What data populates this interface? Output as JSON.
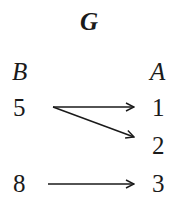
{
  "diagram": {
    "title": "G",
    "domain_label": "B",
    "codomain_label": "A",
    "domain": [
      "5",
      "8"
    ],
    "codomain": [
      "1",
      "2",
      "3"
    ],
    "mappings": [
      {
        "from": "5",
        "to": "1"
      },
      {
        "from": "5",
        "to": "2"
      },
      {
        "from": "8",
        "to": "3"
      }
    ]
  }
}
